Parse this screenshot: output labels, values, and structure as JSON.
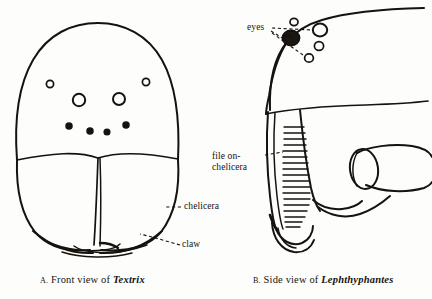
{
  "figure": {
    "kind": "scientific-line-drawing",
    "background_color": "#fdfdfb",
    "ink_color": "#16130f"
  },
  "panel_a": {
    "caption_index": "A.",
    "caption_text": "Front view of",
    "caption_taxon": "Textrix",
    "labels": {
      "chelicera": "chelicera",
      "claw": "claw"
    },
    "eyes": {
      "count": 8,
      "rows": [
        {
          "name": "upper-lateral",
          "eyes": [
            {
              "cx": 50,
              "cy": 84,
              "r": 3.6,
              "style": "ring-sm"
            },
            {
              "cx": 146,
              "cy": 82,
              "r": 3.6,
              "style": "ring-sm"
            }
          ]
        },
        {
          "name": "anterior-median",
          "eyes": [
            {
              "cx": 79,
              "cy": 100,
              "r": 6.2,
              "style": "ring"
            },
            {
              "cx": 119,
              "cy": 99,
              "r": 6.0,
              "style": "ring"
            }
          ]
        },
        {
          "name": "lower-row",
          "eyes": [
            {
              "cx": 69,
              "cy": 126,
              "r": 3.0,
              "style": "dot"
            },
            {
              "cx": 90,
              "cy": 131,
              "r": 3.0,
              "style": "dot"
            },
            {
              "cx": 107,
              "cy": 132,
              "r": 2.8,
              "style": "dot"
            },
            {
              "cx": 126,
              "cy": 125,
              "r": 3.0,
              "style": "dot"
            }
          ]
        }
      ]
    }
  },
  "panel_b": {
    "caption_index": "B.",
    "caption_text": "Side view of",
    "caption_taxon": "Lephthyphantes",
    "labels": {
      "eyes": "eyes",
      "file_line1": "file on-",
      "file_line2": "chelicera"
    },
    "file": {
      "description": "stridulatory file striations on chelicera",
      "stripe_count": 20
    },
    "eyes": {
      "count": 5,
      "items": [
        {
          "cx": 291,
          "cy": 38,
          "rx": 8.5,
          "ry": 7.5,
          "style": "solid-tubercle"
        },
        {
          "cx": 294,
          "cy": 23,
          "rx": 4.0,
          "ry": 3.6,
          "style": "ring"
        },
        {
          "cx": 320,
          "cy": 30,
          "rx": 7.2,
          "ry": 6.4,
          "style": "ring"
        },
        {
          "cx": 319,
          "cy": 46,
          "rx": 4.6,
          "ry": 4.4,
          "style": "ring"
        },
        {
          "cx": 309,
          "cy": 58,
          "rx": 4.4,
          "ry": 4.2,
          "style": "ring"
        }
      ]
    }
  }
}
